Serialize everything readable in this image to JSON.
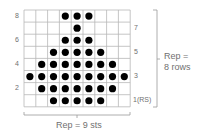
{
  "chart": {
    "columns": 9,
    "rows": 8,
    "symbol": "filled-dot",
    "dot_color": "#000000",
    "grid_color": "#b8b8b8",
    "pattern": [
      {
        "row": 8,
        "dots": [
          4,
          5,
          6
        ]
      },
      {
        "row": 7,
        "dots": [
          5
        ]
      },
      {
        "row": 6,
        "dots": [
          4,
          5,
          6
        ]
      },
      {
        "row": 5,
        "dots": [
          3,
          4,
          5,
          6,
          7
        ]
      },
      {
        "row": 4,
        "dots": [
          2,
          3,
          4,
          5,
          6,
          7,
          8
        ]
      },
      {
        "row": 3,
        "dots": [
          1,
          2,
          3,
          4,
          5,
          6,
          7,
          8,
          9
        ]
      },
      {
        "row": 2,
        "dots": [
          2,
          3,
          4,
          5,
          6,
          7,
          8
        ]
      },
      {
        "row": 1,
        "dots": [
          3,
          4,
          5,
          6,
          7
        ]
      }
    ]
  },
  "row_labels": {
    "left": [
      "8",
      "6",
      "4",
      "2"
    ],
    "right": [
      "7",
      "5",
      "3",
      "1(RS)"
    ]
  },
  "repeat": {
    "horizontal": "Rep = 9 sts",
    "vertical_line1": "Rep =",
    "vertical_line2": "8 rows"
  }
}
